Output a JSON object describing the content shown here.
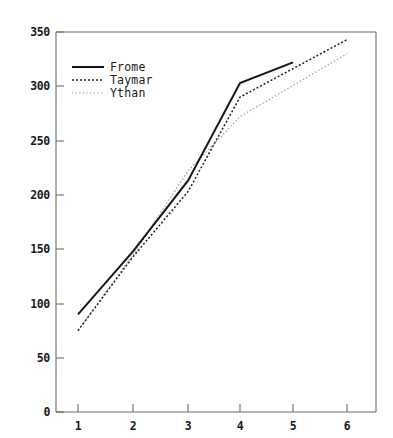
{
  "chart_data": {
    "type": "line",
    "title": "",
    "xlabel": "",
    "ylabel": "",
    "x": [
      1,
      2,
      3,
      4,
      5,
      6
    ],
    "xticklabels": [
      "1",
      "2",
      "3",
      "4",
      "5",
      "6"
    ],
    "yticklabels": [
      "0",
      "50",
      "100",
      "150",
      "200",
      "250",
      "300",
      "350"
    ],
    "yticks": [
      0,
      50,
      100,
      150,
      200,
      250,
      300,
      350
    ],
    "xlim": [
      0.6,
      6.5
    ],
    "ylim": [
      0,
      350
    ],
    "grid": false,
    "legend_position": "upper-left",
    "series": [
      {
        "name": "Frome",
        "style": "solid",
        "color": "#161616",
        "x": [
          1,
          2,
          3,
          4,
          5
        ],
        "values": [
          90,
          148,
          213,
          303,
          322
        ]
      },
      {
        "name": "Taymar",
        "style": "dashed",
        "color": "#202020",
        "x": [
          1,
          2,
          3,
          4,
          6
        ],
        "values": [
          75,
          143,
          203,
          290,
          343
        ]
      },
      {
        "name": "Ythan",
        "style": "dotted",
        "color": "#9a9a9a",
        "x": [
          1,
          2,
          3,
          4,
          6
        ],
        "values": [
          75,
          145,
          222,
          272,
          330
        ]
      }
    ]
  },
  "axes": {
    "y_tick_0": "0",
    "y_tick_50": "50",
    "y_tick_100": "100",
    "y_tick_150": "150",
    "y_tick_200": "200",
    "y_tick_250": "250",
    "y_tick_300": "300",
    "y_tick_350": "350",
    "x_tick_1": "1",
    "x_tick_2": "2",
    "x_tick_3": "3",
    "x_tick_4": "4",
    "x_tick_5": "5",
    "x_tick_6": "6"
  },
  "legend": {
    "items": [
      {
        "label": "Frome"
      },
      {
        "label": "Taymar"
      },
      {
        "label": "Ythan"
      }
    ]
  }
}
